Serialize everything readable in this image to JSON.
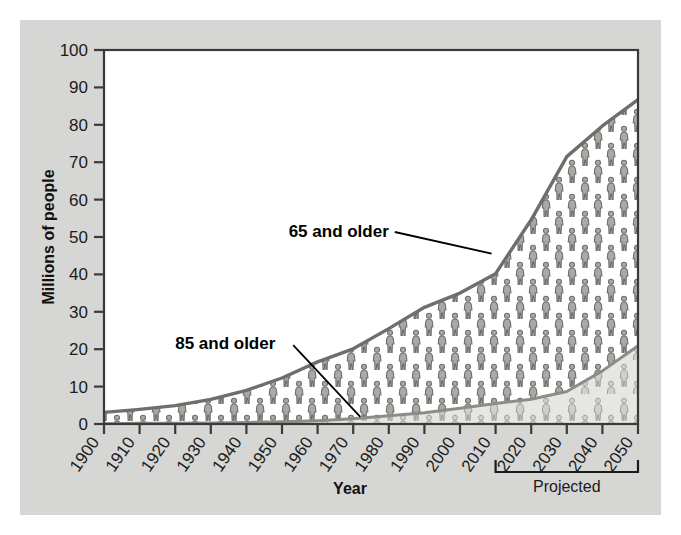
{
  "chart_data": {
    "type": "area",
    "title": "",
    "subtitle": "",
    "xlabel": "Year",
    "ylabel": "Millions of people",
    "xlim": [
      1900,
      2050
    ],
    "ylim": [
      0,
      100
    ],
    "grid": false,
    "legend_position": "inline-annotation",
    "x": [
      1900,
      1910,
      1920,
      1930,
      1940,
      1950,
      1960,
      1970,
      1980,
      1990,
      2000,
      2010,
      2020,
      2030,
      2040,
      2050
    ],
    "xticklabels": [
      "1900",
      "1910",
      "1920",
      "1930",
      "1940",
      "1950",
      "1960",
      "1970",
      "1980",
      "1990",
      "2000",
      "2010",
      "2020",
      "2030",
      "2040",
      "2050"
    ],
    "yticklabels": [
      "0",
      "10",
      "20",
      "30",
      "40",
      "50",
      "60",
      "70",
      "80",
      "90",
      "100"
    ],
    "yticks": [
      0,
      10,
      20,
      30,
      40,
      50,
      60,
      70,
      80,
      90,
      100
    ],
    "series": [
      {
        "name": "65 and older",
        "values": [
          3.1,
          3.9,
          4.9,
          6.6,
          9.0,
          12.3,
          16.6,
          20.1,
          25.5,
          31.2,
          35.0,
          40.2,
          54.6,
          71.5,
          79.7,
          86.7
        ]
      },
      {
        "name": "85 and older",
        "values": [
          0.1,
          0.2,
          0.2,
          0.3,
          0.4,
          0.6,
          0.9,
          1.4,
          2.2,
          3.0,
          4.2,
          5.5,
          6.6,
          8.7,
          14.2,
          20.9
        ]
      }
    ],
    "annotations": [
      {
        "text": "65 and older",
        "x": 1980,
        "y": 50
      },
      {
        "text": "85 and older",
        "x": 1920,
        "y": 20
      },
      {
        "text": "Projected",
        "x": 2030,
        "y": -18
      }
    ],
    "projected_bracket": {
      "label": "Projected",
      "from": 2010,
      "to": 2050
    },
    "colors": {
      "panel_background": "#d6d6d4",
      "plot_background": "#ffffff",
      "axis_line": "#3a3a3a",
      "series_65_fill": "#a9a9a6",
      "series_65_line": "#6e6e6b",
      "series_85_fill": "#cfcfcb",
      "series_85_line": "#8c8c88",
      "text": "#1b1b1b"
    }
  },
  "axis": {
    "ylabel": "Millions of people",
    "xlabel": "Year"
  },
  "labels": {
    "series_65": "65 and older",
    "series_85": "85 and older",
    "projected": "Projected"
  }
}
